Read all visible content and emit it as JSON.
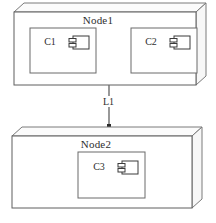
{
  "diagram": {
    "type": "uml-deployment-diagram",
    "background": "#ffffff",
    "line_color": "#5f5f5f",
    "nodes": [
      {
        "id": "node1",
        "label": "Node1",
        "components": [
          {
            "id": "c1",
            "label": "C1",
            "icon": "component-icon"
          },
          {
            "id": "c2",
            "label": "C2",
            "icon": "component-icon"
          }
        ]
      },
      {
        "id": "node2",
        "label": "Node2",
        "components": [
          {
            "id": "c3",
            "label": "C3",
            "icon": "component-icon"
          }
        ]
      }
    ],
    "connections": [
      {
        "id": "l1",
        "label": "L1",
        "from": "node1",
        "to": "node2",
        "endpoint_marker": "dot"
      }
    ],
    "caption": ""
  }
}
